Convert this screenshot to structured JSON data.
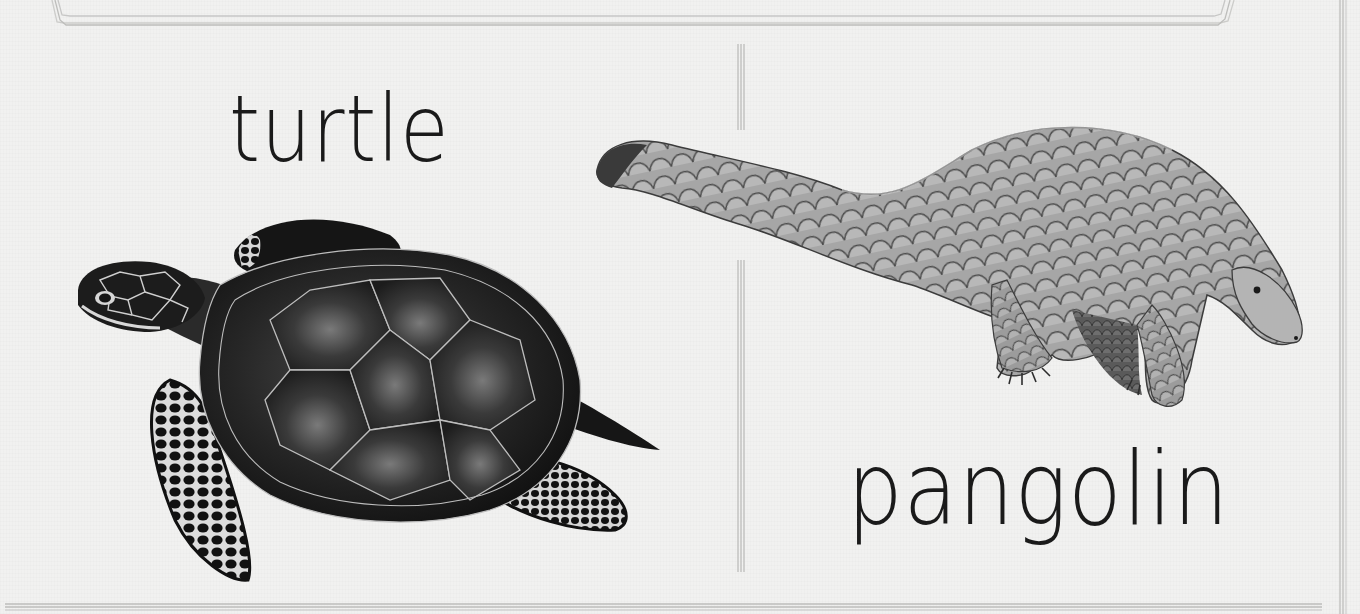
{
  "page": {
    "background_color": "#f1f1f0",
    "line_color": "#b8b8b6",
    "ink_color": "#1a1a1a"
  },
  "cards": [
    {
      "label": "turtle",
      "illustration": "sea-turtle-illustration"
    },
    {
      "label": "pangolin",
      "illustration": "pangolin-illustration"
    }
  ]
}
